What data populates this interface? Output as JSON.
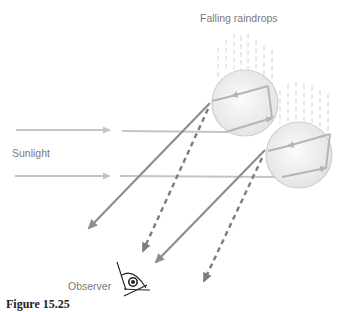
{
  "diagram": {
    "title": "Falling raindrops",
    "labels": {
      "sunlight": "Sunlight",
      "observer": "Observer"
    },
    "caption": "Figure 15.25",
    "colors": {
      "sunlight_ray": "#c4c4c4",
      "exit_ray_solid": "#8e8e8e",
      "exit_ray_dashed": "#7c7c7c",
      "raindrop_fill": "#ececec",
      "raindrop_stroke": "#cfcfcf",
      "internal_ray": "#b5b5b5",
      "rain_streak": "#d2d2d2",
      "label_text": "#7a7a7a",
      "eye": "#222222"
    },
    "elements": {
      "raindrops": [
        {
          "id": "drop-upper",
          "cx": 245,
          "cy": 103,
          "r": 33
        },
        {
          "id": "drop-lower",
          "cx": 299,
          "cy": 155,
          "r": 33
        }
      ],
      "incoming_rays": [
        {
          "id": "sunlight-ray-1",
          "y": 130
        },
        {
          "id": "sunlight-ray-2",
          "y": 176
        }
      ],
      "exit_rays": [
        {
          "id": "solid-ray-1",
          "style": "solid",
          "from": [
            210,
            103
          ],
          "to": [
            88,
            229
          ]
        },
        {
          "id": "dashed-ray-1",
          "style": "dashed",
          "from": [
            208,
            109
          ],
          "to": [
            142,
            253
          ]
        },
        {
          "id": "solid-ray-2",
          "style": "solid",
          "from": [
            265,
            150
          ],
          "to": [
            155,
            263
          ]
        },
        {
          "id": "dashed-ray-2",
          "style": "dashed",
          "from": [
            262,
            158
          ],
          "to": [
            203,
            283
          ]
        }
      ],
      "observer_eye": {
        "x": 132,
        "y": 283
      }
    }
  }
}
